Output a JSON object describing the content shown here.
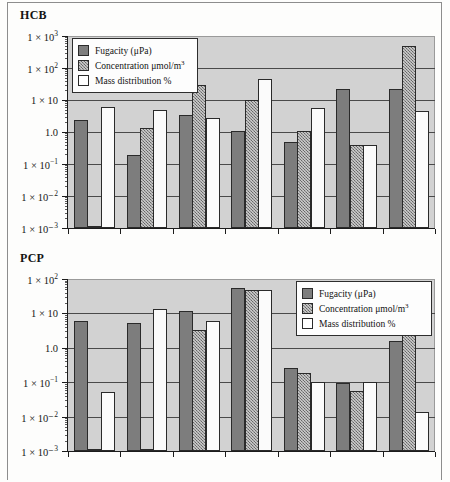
{
  "figure": {
    "background_color": "#fdfdfc",
    "frame_color": "#8d8d8d",
    "plot_background": "#d2d2d2"
  },
  "panels": [
    {
      "id": "hcb",
      "title": "HCB",
      "legend_position": "top-left",
      "chart_data": {
        "type": "bar",
        "title": "HCB",
        "xlabel": "",
        "ylabel": "",
        "yscale": "log",
        "ylim": [
          0.001,
          1000
        ],
        "ytick_labels": [
          "1 × 10³",
          "1 × 10²",
          "1 × 10",
          "1.0",
          "1 × 10⁻¹",
          "1 × 10⁻²",
          "1 × 10⁻³"
        ],
        "ytick_values": [
          1000,
          100,
          10,
          1,
          0.1,
          0.01,
          0.001
        ],
        "grid": true,
        "legend_position": "top-left",
        "categories": [
          "1",
          "2",
          "3",
          "4",
          "5",
          "6",
          "7"
        ],
        "series": [
          {
            "name": "Fugacity (μPa)",
            "fill": "solid-grey",
            "values": [
              2.4,
              0.19,
              3.3,
              1.1,
              0.5,
              22,
              22
            ]
          },
          {
            "name": "Concentration μmol/m³",
            "fill": "hatched-grey",
            "values": [
              0.0011,
              1.3,
              30,
              10,
              1.1,
              0.4,
              500
            ]
          },
          {
            "name": "Mass distribution %",
            "fill": "white",
            "values": [
              6.2,
              5.0,
              2.8,
              45,
              5.8,
              0.4,
              4.6
            ]
          }
        ]
      }
    },
    {
      "id": "pcp",
      "title": "PCP",
      "legend_position": "top-right",
      "chart_data": {
        "type": "bar",
        "title": "PCP",
        "xlabel": "",
        "ylabel": "",
        "yscale": "log",
        "ylim": [
          0.001,
          100
        ],
        "ytick_labels": [
          "1 × 10²",
          "1 × 10",
          "1.0",
          "1 × 10⁻¹",
          "1 × 10⁻²",
          "1 × 10⁻³"
        ],
        "ytick_values": [
          100,
          10,
          1,
          0.1,
          0.01,
          0.001
        ],
        "grid": true,
        "legend_position": "top-right",
        "categories": [
          "1",
          "2",
          "3",
          "4",
          "5",
          "6",
          "7"
        ],
        "series": [
          {
            "name": "Fugacity (μPa)",
            "fill": "solid-grey",
            "values": [
              6.0,
              5.2,
              12.0,
              55,
              0.26,
              0.095,
              1.6
            ]
          },
          {
            "name": "Concentration μmol/m³",
            "fill": "hatched-grey",
            "values": [
              0.0011,
              0.0011,
              3.2,
              48,
              0.18,
              0.055,
              12.0
            ]
          },
          {
            "name": "Mass distribution %",
            "fill": "white",
            "values": [
              0.052,
              13.0,
              6.0,
              48,
              0.1,
              0.1,
              0.014
            ]
          }
        ]
      }
    }
  ],
  "legend": {
    "entries": [
      {
        "label_prefix": "Fugacity (μPa)",
        "text": "Fugacity (μPa)",
        "fill": "solid-grey"
      },
      {
        "label_prefix": "Concentration μmol/m",
        "text": "Concentration μmol/m³",
        "sup": "3",
        "base": "Concentration μmol/m",
        "fill": "hatched-grey"
      },
      {
        "label_prefix": "Mass distribution %",
        "text": "Mass distribution %",
        "fill": "white"
      }
    ]
  }
}
